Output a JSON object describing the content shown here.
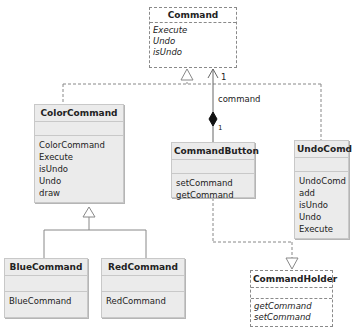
{
  "diagram": {
    "type": "uml-class-diagram",
    "classes": {
      "command": {
        "name": "Command",
        "style": "interface-dashed",
        "attributes": [],
        "operations": [
          "Execute",
          "Undo",
          "isUndo"
        ]
      },
      "color_command": {
        "name": "ColorCommand",
        "attributes": [],
        "operations": [
          "ColorCommand",
          "Execute",
          "isUndo",
          "Undo",
          "draw"
        ]
      },
      "command_button": {
        "name": "CommandButton",
        "attributes": [],
        "operations": [
          "setCommand",
          "getCommand"
        ]
      },
      "undo_comd": {
        "name": "UndoComd",
        "attributes": [],
        "operations": [
          "UndoComd",
          "add",
          "isUndo",
          "Undo",
          "Execute"
        ]
      },
      "blue_command": {
        "name": "BlueCommand",
        "attributes": [],
        "operations": [
          "BlueCommand"
        ]
      },
      "red_command": {
        "name": "RedCommand",
        "attributes": [],
        "operations": [
          "RedCommand"
        ]
      },
      "command_holder": {
        "name": "CommandHolder",
        "style": "interface-dashed",
        "attributes": [],
        "operations": [
          "getCommand",
          "setCommand"
        ]
      }
    },
    "relationships": [
      {
        "type": "realization",
        "from": "ColorCommand",
        "to": "Command"
      },
      {
        "type": "realization",
        "from": "UndoComd",
        "to": "Command"
      },
      {
        "type": "composition-association",
        "from": "CommandButton",
        "to": "Command",
        "role": "command",
        "multiplicity_source": "1",
        "multiplicity_target": "1"
      },
      {
        "type": "generalization",
        "from": "BlueCommand",
        "to": "ColorCommand"
      },
      {
        "type": "generalization",
        "from": "RedCommand",
        "to": "ColorCommand"
      },
      {
        "type": "realization",
        "from": "CommandButton",
        "to": "CommandHolder"
      }
    ],
    "labels": {
      "association_role": "command",
      "multiplicity_top": "1",
      "multiplicity_bottom": "1"
    },
    "colors": {
      "class_fill": "#ebebeb",
      "class_border": "#c8c8c8",
      "interface_fill": "#ffffff",
      "line": "#888888"
    }
  }
}
